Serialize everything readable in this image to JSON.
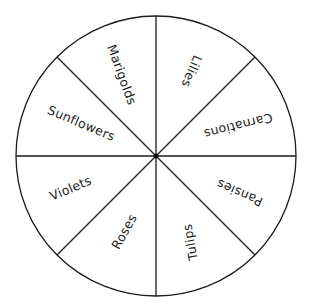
{
  "diagram": {
    "type": "spinner-wheel",
    "center": [
      156,
      156
    ],
    "radius": 140,
    "sector_count": 8,
    "line_color": "#1a1a1a",
    "background": "#ffffff",
    "sectors": [
      {
        "label": "Marigolds",
        "x": 121,
        "y": 75,
        "angle": 70
      },
      {
        "label": "Lilies",
        "x": 191,
        "y": 71,
        "angle": 113
      },
      {
        "label": "Carnations",
        "x": 238,
        "y": 125,
        "angle": 166
      },
      {
        "label": "Pansies",
        "x": 240,
        "y": 192,
        "angle": 204
      },
      {
        "label": "Tulips",
        "x": 191,
        "y": 242,
        "angle": -100
      },
      {
        "label": "Roses",
        "x": 125,
        "y": 232,
        "angle": -61
      },
      {
        "label": "Violets",
        "x": 71,
        "y": 189,
        "angle": -23
      },
      {
        "label": "Sunflowers",
        "x": 81,
        "y": 124,
        "angle": 23
      }
    ]
  }
}
